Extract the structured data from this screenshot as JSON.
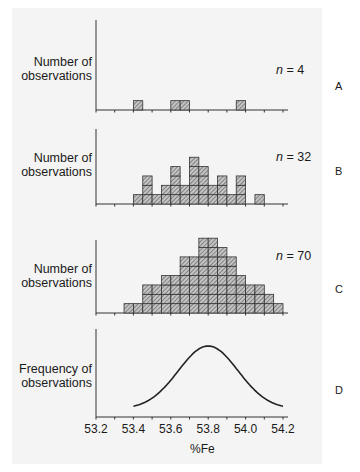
{
  "chart_data": [
    {
      "panel": "A",
      "type": "bar",
      "title": "",
      "ylabel": "Number of observations",
      "xlabel": "%Fe",
      "annotation": "n = 4",
      "bin_width": 0.05,
      "bin_starts": [
        53.4,
        53.6,
        53.65,
        53.95
      ],
      "values": [
        1,
        1,
        1,
        1
      ],
      "n": 4
    },
    {
      "panel": "B",
      "type": "bar",
      "ylabel": "Number of observations",
      "xlabel": "%Fe",
      "annotation": "n = 32",
      "bin_width": 0.05,
      "bin_starts": [
        53.4,
        53.45,
        53.5,
        53.55,
        53.6,
        53.65,
        53.7,
        53.75,
        53.8,
        53.85,
        53.9,
        53.95,
        54.0,
        54.05
      ],
      "values": [
        1,
        3,
        1,
        2,
        4,
        2,
        5,
        4,
        2,
        3,
        1,
        3,
        0,
        1
      ],
      "n": 32
    },
    {
      "panel": "C",
      "type": "bar",
      "ylabel": "Number of observations",
      "xlabel": "%Fe",
      "annotation": "n = 70",
      "bin_width": 0.05,
      "bin_starts": [
        53.35,
        53.4,
        53.45,
        53.5,
        53.55,
        53.6,
        53.65,
        53.7,
        53.75,
        53.8,
        53.85,
        53.9,
        53.95,
        54.0,
        54.05,
        54.1,
        54.15
      ],
      "values": [
        1,
        1,
        3,
        3,
        4,
        4,
        6,
        6,
        8,
        8,
        7,
        6,
        4,
        3,
        3,
        2,
        1
      ],
      "n": 70
    },
    {
      "panel": "D",
      "type": "line",
      "ylabel": "Frequency of observations",
      "xlabel": "%Fe",
      "description": "normal distribution curve",
      "mean": 53.8,
      "x": [
        53.4,
        53.5,
        53.6,
        53.7,
        53.8,
        53.9,
        54.0,
        54.1,
        54.2
      ],
      "y_relative": [
        0.07,
        0.25,
        0.6,
        0.92,
        1.0,
        0.92,
        0.6,
        0.25,
        0.1
      ]
    }
  ],
  "axis": {
    "xlim": [
      53.2,
      54.25
    ],
    "ticks": [
      "53.2",
      "53.4",
      "53.6",
      "53.8",
      "54.0",
      "54.2"
    ],
    "xlabel": "%Fe"
  },
  "labels": {
    "a_ylabel": "Number of observations",
    "b_ylabel": "Number of observations",
    "c_ylabel": "Number of observations",
    "d_ylabel": "Frequency of observations",
    "a_n": "n",
    "a_n_val": " = 4",
    "b_n": "n",
    "b_n_val": " = 32",
    "c_n": "n",
    "c_n_val": " = 70",
    "panel_a": "A",
    "panel_b": "B",
    "panel_c": "C",
    "panel_d": "D"
  },
  "colors": {
    "background": "#ffffff",
    "page": "#f4f4f4",
    "ink": "#1a1a1a",
    "hatch_fill": "#b8b8b8"
  }
}
